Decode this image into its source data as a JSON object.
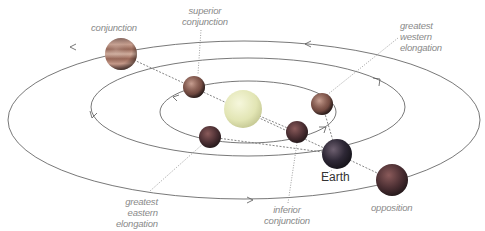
{
  "sun": {
    "name": "Sun",
    "color": "#e4e6b8"
  },
  "orbits": [
    {
      "name": "inferior-planet-orbit",
      "direction_arrows": 2
    },
    {
      "name": "earth-orbit",
      "direction_arrows": 2
    },
    {
      "name": "superior-planet-orbit",
      "direction_arrows": 2
    }
  ],
  "labels": {
    "conjunction": [
      "conjunction"
    ],
    "superior_conjunction": [
      "superior",
      "conjunction"
    ],
    "greatest_western_elongation": [
      "greatest",
      "western",
      "elongation"
    ],
    "greatest_eastern_elongation": [
      "greatest",
      "eastern",
      "elongation"
    ],
    "inferior_conjunction": [
      "inferior",
      "conjunction"
    ],
    "opposition": [
      "opposition"
    ],
    "earth": "Earth"
  },
  "colors": {
    "orbit_line": "#555555",
    "label_text": "#8a8a8a",
    "guide_line": "#777777",
    "earth": "#3a3a48",
    "superior_planet": "#6a4a48",
    "inferior_planet": "#7a4e48"
  }
}
